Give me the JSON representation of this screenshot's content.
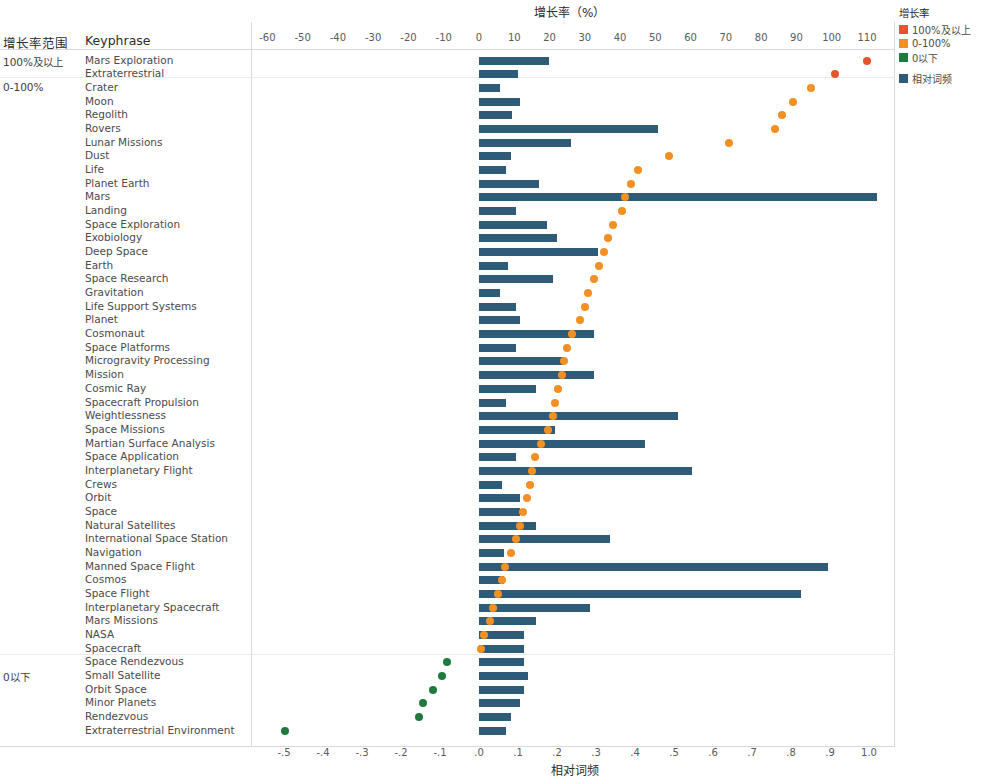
{
  "chart_title_top": "增长率（%）",
  "chart_title_bottom": "相对词频",
  "columns": {
    "group": "增长率范围",
    "keyphrase": "Keyphrase"
  },
  "legend": {
    "title": "增长率",
    "items": [
      {
        "label": "100%及以上",
        "color": "#e8542a"
      },
      {
        "label": "0-100%",
        "color": "#f29024"
      },
      {
        "label": "0以下",
        "color": "#1f7a3d"
      }
    ],
    "bar_item": {
      "label": "相对词频",
      "color": "#2e5c78"
    }
  },
  "groups": [
    {
      "label": "100%及以上",
      "start_index": 0
    },
    {
      "label": "0-100%",
      "start_index": 2
    },
    {
      "label": "0以下",
      "start_index": 45
    }
  ],
  "chart_data": {
    "type": "bar",
    "title": "增长率（%）",
    "xlabel_top": "增长率（%）",
    "xlabel_bottom": "相对词频",
    "ylabel": "Keyphrase",
    "top_axis": {
      "name": "增长率（%）",
      "ticks": [
        -60,
        -50,
        -40,
        -30,
        -20,
        -10,
        0,
        10,
        20,
        30,
        40,
        50,
        60,
        70,
        80,
        90,
        100,
        110
      ],
      "range": [
        -65,
        115
      ]
    },
    "bottom_axis": {
      "name": "相对词频",
      "ticks": [
        "-.5",
        "-.4",
        "-.3",
        "-.2",
        "-.1",
        ".0",
        ".1",
        ".2",
        ".3",
        ".4",
        ".5",
        ".6",
        ".7",
        ".8",
        ".9",
        "1.0"
      ],
      "tick_values": [
        -0.5,
        -0.4,
        -0.3,
        -0.2,
        -0.1,
        0.0,
        0.1,
        0.2,
        0.3,
        0.4,
        0.5,
        0.6,
        0.7,
        0.8,
        0.9,
        1.0
      ],
      "range": [
        -0.55,
        1.05
      ]
    },
    "series": [
      {
        "name": "相对词频",
        "type": "bar",
        "color": "#2e5c78"
      },
      {
        "name": "增长率",
        "type": "scatter",
        "colors": {
          "100%及以上": "#e8542a",
          "0-100%": "#f29024",
          "0以下": "#1f7a3d"
        }
      }
    ],
    "categories": [
      "Mars Exploration",
      "Extraterrestrial",
      "Crater",
      "Moon",
      "Regolith",
      "Rovers",
      "Lunar Missions",
      "Dust",
      "Life",
      "Planet Earth",
      "Mars",
      "Landing",
      "Space Exploration",
      "Exobiology",
      "Deep Space",
      "Earth",
      "Space Research",
      "Gravitation",
      "Life Support Systems",
      "Planet",
      "Cosmonaut",
      "Space Platforms",
      "Microgravity Processing",
      "Mission",
      "Cosmic Ray",
      "Spacecraft Propulsion",
      "Weightlessness",
      "Space Missions",
      "Martian Surface Analysis",
      "Space Application",
      "Interplanetary Flight",
      "Crews",
      "Orbit",
      "Space",
      "Natural Satellites",
      "International Space Station",
      "Navigation",
      "Manned Space Flight",
      "Cosmos",
      "Space Flight",
      "Interplanetary Spacecraft",
      "Mars Missions",
      "NASA",
      "Spacecraft",
      "Space Rendezvous",
      "Small Satellite",
      "Orbit Space",
      "Minor Planets",
      "Rendezvous",
      "Extraterrestrial Environment"
    ],
    "rows": [
      {
        "keyphrase": "Mars Exploration",
        "group": "100%及以上",
        "rel_freq": 0.18,
        "growth": 110.0
      },
      {
        "keyphrase": "Extraterrestrial",
        "group": "100%及以上",
        "rel_freq": 0.1,
        "growth": 101.0
      },
      {
        "keyphrase": "Crater",
        "group": "0-100%",
        "rel_freq": 0.055,
        "growth": 94.0
      },
      {
        "keyphrase": "Moon",
        "group": "0-100%",
        "rel_freq": 0.105,
        "growth": 89.0
      },
      {
        "keyphrase": "Regolith",
        "group": "0-100%",
        "rel_freq": 0.085,
        "growth": 86.0
      },
      {
        "keyphrase": "Rovers",
        "group": "0-100%",
        "rel_freq": 0.46,
        "growth": 84.0
      },
      {
        "keyphrase": "Lunar Missions",
        "group": "0-100%",
        "rel_freq": 0.235,
        "growth": 71.0
      },
      {
        "keyphrase": "Dust",
        "group": "0-100%",
        "rel_freq": 0.082,
        "growth": 54.0
      },
      {
        "keyphrase": "Life",
        "group": "0-100%",
        "rel_freq": 0.068,
        "growth": 45.0
      },
      {
        "keyphrase": "Planet Earth",
        "group": "0-100%",
        "rel_freq": 0.155,
        "growth": 43.0
      },
      {
        "keyphrase": "Mars",
        "group": "0-100%",
        "rel_freq": 1.02,
        "growth": 41.5
      },
      {
        "keyphrase": "Landing",
        "group": "0-100%",
        "rel_freq": 0.095,
        "growth": 40.5
      },
      {
        "keyphrase": "Space Exploration",
        "group": "0-100%",
        "rel_freq": 0.175,
        "growth": 38.0
      },
      {
        "keyphrase": "Exobiology",
        "group": "0-100%",
        "rel_freq": 0.2,
        "growth": 36.5
      },
      {
        "keyphrase": "Deep Space",
        "group": "0-100%",
        "rel_freq": 0.305,
        "growth": 35.5
      },
      {
        "keyphrase": "Earth",
        "group": "0-100%",
        "rel_freq": 0.075,
        "growth": 34.0
      },
      {
        "keyphrase": "Space Research",
        "group": "0-100%",
        "rel_freq": 0.19,
        "growth": 32.5
      },
      {
        "keyphrase": "Gravitation",
        "group": "0-100%",
        "rel_freq": 0.055,
        "growth": 31.0
      },
      {
        "keyphrase": "Life Support Systems",
        "group": "0-100%",
        "rel_freq": 0.095,
        "growth": 30.0
      },
      {
        "keyphrase": "Planet",
        "group": "0-100%",
        "rel_freq": 0.105,
        "growth": 28.5
      },
      {
        "keyphrase": "Cosmonaut",
        "group": "0-100%",
        "rel_freq": 0.295,
        "growth": 26.5
      },
      {
        "keyphrase": "Space Platforms",
        "group": "0-100%",
        "rel_freq": 0.095,
        "growth": 25.0
      },
      {
        "keyphrase": "Microgravity Processing",
        "group": "0-100%",
        "rel_freq": 0.215,
        "growth": 24.0
      },
      {
        "keyphrase": "Mission",
        "group": "0-100%",
        "rel_freq": 0.295,
        "growth": 23.5
      },
      {
        "keyphrase": "Cosmic Ray",
        "group": "0-100%",
        "rel_freq": 0.145,
        "growth": 22.5
      },
      {
        "keyphrase": "Spacecraft Propulsion",
        "group": "0-100%",
        "rel_freq": 0.068,
        "growth": 21.5
      },
      {
        "keyphrase": "Weightlessness",
        "group": "0-100%",
        "rel_freq": 0.51,
        "growth": 21.0
      },
      {
        "keyphrase": "Space Missions",
        "group": "0-100%",
        "rel_freq": 0.195,
        "growth": 19.5
      },
      {
        "keyphrase": "Martian Surface Analysis",
        "group": "0-100%",
        "rel_freq": 0.425,
        "growth": 17.5
      },
      {
        "keyphrase": "Space Application",
        "group": "0-100%",
        "rel_freq": 0.095,
        "growth": 16.0
      },
      {
        "keyphrase": "Interplanetary Flight",
        "group": "0-100%",
        "rel_freq": 0.545,
        "growth": 15.0
      },
      {
        "keyphrase": "Crews",
        "group": "0-100%",
        "rel_freq": 0.06,
        "growth": 14.5
      },
      {
        "keyphrase": "Orbit",
        "group": "0-100%",
        "rel_freq": 0.105,
        "growth": 13.5
      },
      {
        "keyphrase": "Space",
        "group": "0-100%",
        "rel_freq": 0.105,
        "growth": 12.5
      },
      {
        "keyphrase": "Natural Satellites",
        "group": "0-100%",
        "rel_freq": 0.145,
        "growth": 11.5
      },
      {
        "keyphrase": "International Space Station",
        "group": "0-100%",
        "rel_freq": 0.335,
        "growth": 10.5
      },
      {
        "keyphrase": "Navigation",
        "group": "0-100%",
        "rel_freq": 0.065,
        "growth": 9.0
      },
      {
        "keyphrase": "Manned Space Flight",
        "group": "0-100%",
        "rel_freq": 0.895,
        "growth": 7.5
      },
      {
        "keyphrase": "Cosmos",
        "group": "0-100%",
        "rel_freq": 0.065,
        "growth": 6.5
      },
      {
        "keyphrase": "Space Flight",
        "group": "0-100%",
        "rel_freq": 0.825,
        "growth": 5.5
      },
      {
        "keyphrase": "Interplanetary Spacecraft",
        "group": "0-100%",
        "rel_freq": 0.285,
        "growth": 4.0
      },
      {
        "keyphrase": "Mars Missions",
        "group": "0-100%",
        "rel_freq": 0.145,
        "growth": 3.0
      },
      {
        "keyphrase": "NASA",
        "group": "0-100%",
        "rel_freq": 0.115,
        "growth": 1.5
      },
      {
        "keyphrase": "Spacecraft",
        "group": "0-100%",
        "rel_freq": 0.115,
        "growth": 0.5
      },
      {
        "keyphrase": "Space Rendezvous",
        "group": "0以下",
        "rel_freq": 0.115,
        "growth": -9.0
      },
      {
        "keyphrase": "Small Satellite",
        "group": "0以下",
        "rel_freq": 0.125,
        "growth": -10.5
      },
      {
        "keyphrase": "Orbit Space",
        "group": "0以下",
        "rel_freq": 0.115,
        "growth": -13.0
      },
      {
        "keyphrase": "Minor Planets",
        "group": "0以下",
        "rel_freq": 0.105,
        "growth": -16.0
      },
      {
        "keyphrase": "Rendezvous",
        "group": "0以下",
        "rel_freq": 0.082,
        "growth": -17.0
      },
      {
        "keyphrase": "Extraterrestrial Environment",
        "group": "0以下",
        "rel_freq": 0.068,
        "growth": -55.0
      }
    ]
  }
}
